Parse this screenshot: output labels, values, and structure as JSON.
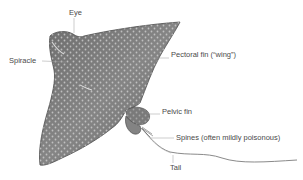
{
  "diagram": {
    "colors": {
      "body_fill": "#7d7d7d",
      "body_dark": "#5e5e5e",
      "spots": "#c9c9c9",
      "outline": "#4d4d4d",
      "leader_line": "#9a9a9a",
      "label_text": "#4a4a4a",
      "background": "#ffffff"
    },
    "labels": {
      "eye": "Eye",
      "spiracle": "Spiracle",
      "pectoral_fin": "Pectoral fin (“wing”)",
      "pelvic_fin": "Pelvic fin",
      "spines": "Spines (often mildly poisonous)",
      "tail": "Tail"
    }
  }
}
